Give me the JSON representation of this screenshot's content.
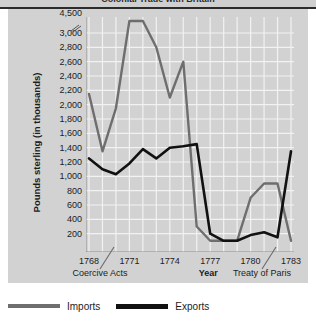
{
  "figure": {
    "clipped_title": "Colonial Trade with Britain",
    "y_axis_title": "Pounds sterling (in thousands)",
    "x_axis_title": "Year"
  },
  "legend": {
    "items": [
      {
        "label": "Imports",
        "color": "#6e6e6e",
        "icon": "line-swatch-icon"
      },
      {
        "label": "Exports",
        "color": "#111111",
        "icon": "line-swatch-icon"
      }
    ]
  },
  "annotations": [
    {
      "label": "Coercive Acts",
      "at_year": 1774
    },
    {
      "label": "Treaty of Paris",
      "at_year": 1783
    }
  ],
  "chart_data": {
    "type": "line",
    "title": "Colonial Trade with Britain",
    "xlabel": "Year",
    "ylabel": "Pounds sterling (in thousands)",
    "xlim": [
      1768,
      1783
    ],
    "ylim": [
      0,
      3100
    ],
    "axis_break": {
      "between": [
        3000,
        4500
      ],
      "note": "y-axis broken between 3,000 and 4,500"
    },
    "grid": true,
    "legend_position": "below",
    "y_ticks": [
      4500,
      3000,
      2800,
      2600,
      2400,
      2200,
      2000,
      1800,
      1600,
      1400,
      1200,
      1000,
      800,
      600,
      400,
      200
    ],
    "x_ticks": [
      1768,
      1771,
      1774,
      1777,
      1780,
      1783
    ],
    "x": [
      1768,
      1769,
      1770,
      1771,
      1772,
      1773,
      1774,
      1775,
      1776,
      1777,
      1778,
      1779,
      1780,
      1781,
      1782,
      1783
    ],
    "series": [
      {
        "name": "Imports",
        "color": "#6e6e6e",
        "values": [
          2150,
          1350,
          1950,
          4200,
          4500,
          2800,
          2100,
          2600,
          300,
          100,
          100,
          100,
          700,
          900,
          900,
          100
        ]
      },
      {
        "name": "Exports",
        "color": "#111111",
        "values": [
          1250,
          1100,
          1030,
          1180,
          1380,
          1250,
          1400,
          1420,
          1450,
          200,
          100,
          100,
          180,
          220,
          150,
          1350
        ]
      }
    ]
  }
}
